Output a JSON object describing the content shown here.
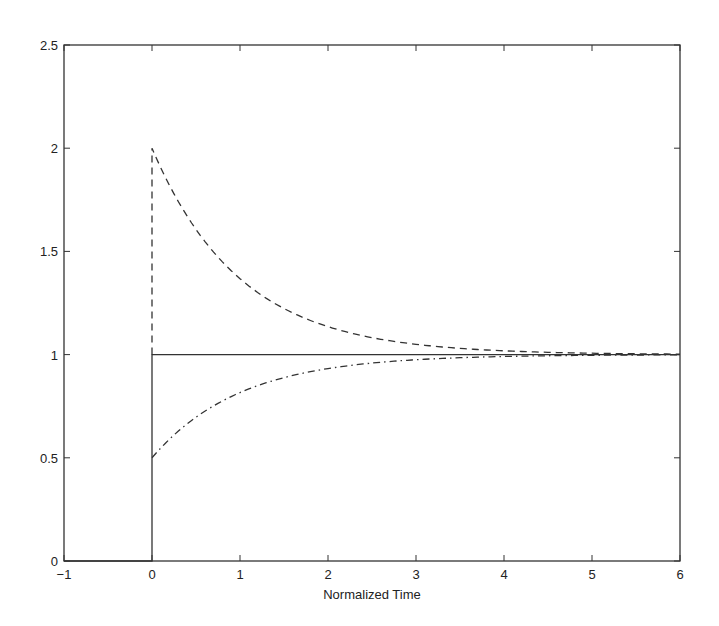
{
  "chart_data": {
    "type": "line",
    "title": "",
    "xlabel": "Normalized Time",
    "ylabel": "",
    "xlim": [
      -1,
      6
    ],
    "ylim": [
      0,
      2.5
    ],
    "grid": false,
    "legend": null,
    "xticks": [
      "-1",
      "0",
      "1",
      "2",
      "3",
      "4",
      "5",
      "6"
    ],
    "yticks": [
      "0",
      "0.5",
      "1",
      "1.5",
      "2",
      "2.5"
    ],
    "series": [
      {
        "name": "step",
        "style": "solid",
        "description": "unit step at t=0",
        "x": [
          -1,
          0,
          0,
          6
        ],
        "y": [
          0,
          0,
          1,
          1
        ]
      },
      {
        "name": "overshoot-decay",
        "style": "dashed",
        "description": "1 + exp(-t), jumps to 2 at t=0",
        "x": [
          0,
          0,
          0.5,
          1,
          1.5,
          2,
          2.5,
          3,
          4,
          5,
          6
        ],
        "y": [
          1,
          2,
          1.61,
          1.37,
          1.22,
          1.14,
          1.08,
          1.05,
          1.02,
          1.01,
          1.0
        ]
      },
      {
        "name": "rise",
        "style": "dash-dot",
        "description": "1 - 0.5*exp(-t), starts at 0.5",
        "x": [
          0,
          0.5,
          1,
          1.5,
          2,
          2.5,
          3,
          4,
          5,
          6
        ],
        "y": [
          0.5,
          0.7,
          0.82,
          0.89,
          0.93,
          0.96,
          0.975,
          0.99,
          0.997,
          1.0
        ]
      }
    ]
  }
}
